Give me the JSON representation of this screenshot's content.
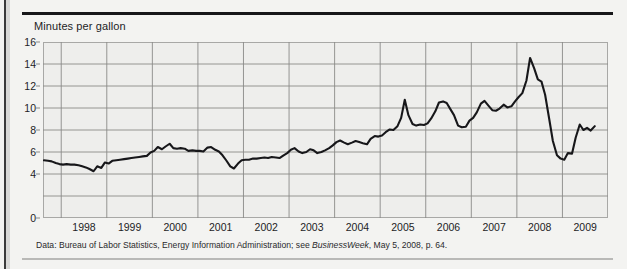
{
  "title": "Minutes per gallon",
  "footnote": {
    "prefix": "Data: Bureau of Labor Statistics, Energy Information Administration; see ",
    "italic": "BusinessWeek",
    "suffix": ", May 5, 2008, p. 64."
  },
  "colors": {
    "line": "#17171a",
    "plot_background": "#eeeeec",
    "page_background": "#f3f3f1",
    "grid": "#8a8a88",
    "frame": "#a8a8a6",
    "text": "#1d1d1f",
    "top_rule": "#17171a",
    "bottom_rule": "#b9b9b7"
  },
  "chart_data": {
    "type": "line",
    "title": "Minutes per gallon",
    "xlabel": "",
    "ylabel": "Minutes per gallon",
    "xlim": [
      1997.6,
      2010.0
    ],
    "ylim": [
      0,
      16
    ],
    "yticks": [
      0,
      2,
      4,
      6,
      8,
      10,
      12,
      14,
      16
    ],
    "ytick_labels": [
      "0",
      "4",
      "6",
      "8",
      "10",
      "12",
      "14",
      "16"
    ],
    "ytick_labels_shown": [
      0,
      4,
      6,
      8,
      10,
      12,
      14,
      16
    ],
    "xticks": [
      1998,
      1999,
      2000,
      2001,
      2002,
      2003,
      2004,
      2005,
      2006,
      2007,
      2008,
      2009,
      2010
    ],
    "xtick_labels": [
      "1998",
      "1999",
      "2000",
      "2001",
      "2002",
      "2003",
      "2004",
      "2005",
      "2006",
      "2007",
      "2008",
      "2009",
      "2010"
    ],
    "grid": true,
    "legend": false,
    "series": [
      {
        "name": "Minutes of work per gallon of gasoline",
        "x": [
          1997.62,
          1997.71,
          1997.79,
          1997.88,
          1997.96,
          1998.04,
          1998.12,
          1998.21,
          1998.29,
          1998.38,
          1998.46,
          1998.54,
          1998.62,
          1998.71,
          1998.79,
          1998.88,
          1998.96,
          1999.04,
          1999.12,
          1999.21,
          1999.29,
          1999.38,
          1999.46,
          1999.54,
          1999.62,
          1999.71,
          1999.79,
          1999.88,
          1999.96,
          2000.04,
          2000.12,
          2000.21,
          2000.29,
          2000.38,
          2000.46,
          2000.54,
          2000.62,
          2000.71,
          2000.79,
          2000.88,
          2000.96,
          2001.04,
          2001.12,
          2001.21,
          2001.29,
          2001.38,
          2001.46,
          2001.54,
          2001.62,
          2001.71,
          2001.79,
          2001.88,
          2001.96,
          2002.04,
          2002.12,
          2002.21,
          2002.29,
          2002.38,
          2002.46,
          2002.54,
          2002.62,
          2002.71,
          2002.79,
          2002.88,
          2002.96,
          2003.04,
          2003.12,
          2003.21,
          2003.29,
          2003.38,
          2003.46,
          2003.54,
          2003.62,
          2003.71,
          2003.79,
          2003.88,
          2003.96,
          2004.04,
          2004.12,
          2004.21,
          2004.29,
          2004.38,
          2004.46,
          2004.54,
          2004.62,
          2004.71,
          2004.79,
          2004.88,
          2004.96,
          2005.04,
          2005.12,
          2005.21,
          2005.29,
          2005.38,
          2005.46,
          2005.54,
          2005.62,
          2005.71,
          2005.79,
          2005.88,
          2005.96,
          2006.04,
          2006.12,
          2006.21,
          2006.29,
          2006.38,
          2006.46,
          2006.54,
          2006.62,
          2006.71,
          2006.79,
          2006.88,
          2006.96,
          2007.04,
          2007.12,
          2007.21,
          2007.29,
          2007.38,
          2007.46,
          2007.54,
          2007.62,
          2007.71,
          2007.79,
          2007.88,
          2007.96,
          2008.04,
          2008.12,
          2008.21,
          2008.29,
          2008.38,
          2008.46,
          2008.54,
          2008.62,
          2008.71,
          2008.79,
          2008.88,
          2008.96,
          2009.04,
          2009.12,
          2009.21,
          2009.29,
          2009.38,
          2009.46,
          2009.54,
          2009.62,
          2009.71
        ],
        "values": [
          5.25,
          5.2,
          5.15,
          5.0,
          4.9,
          4.85,
          4.9,
          4.85,
          4.85,
          4.8,
          4.7,
          4.6,
          4.45,
          4.25,
          4.7,
          4.55,
          5.05,
          4.95,
          5.2,
          5.25,
          5.3,
          5.35,
          5.4,
          5.45,
          5.5,
          5.55,
          5.6,
          5.65,
          5.95,
          6.1,
          6.45,
          6.25,
          6.5,
          6.75,
          6.35,
          6.3,
          6.35,
          6.3,
          6.1,
          6.15,
          6.1,
          6.1,
          6.05,
          6.4,
          6.45,
          6.2,
          6.05,
          5.7,
          5.25,
          4.7,
          4.5,
          4.95,
          5.25,
          5.3,
          5.3,
          5.4,
          5.4,
          5.45,
          5.5,
          5.45,
          5.55,
          5.5,
          5.45,
          5.7,
          5.9,
          6.2,
          6.35,
          6.05,
          5.9,
          6.0,
          6.25,
          6.15,
          5.9,
          6.0,
          6.15,
          6.35,
          6.6,
          6.9,
          7.05,
          6.85,
          6.7,
          6.85,
          7.0,
          6.9,
          6.8,
          6.7,
          7.2,
          7.45,
          7.4,
          7.5,
          7.8,
          8.05,
          8.0,
          8.35,
          9.1,
          10.75,
          9.35,
          8.55,
          8.4,
          8.5,
          8.45,
          8.6,
          9.05,
          9.7,
          10.5,
          10.6,
          10.45,
          9.9,
          9.35,
          8.4,
          8.25,
          8.3,
          8.85,
          9.1,
          9.6,
          10.4,
          10.65,
          10.2,
          9.8,
          9.75,
          9.95,
          10.3,
          10.05,
          10.15,
          10.6,
          11.0,
          11.35,
          12.5,
          14.55,
          13.6,
          12.6,
          12.4,
          11.2,
          9.0,
          7.0,
          5.7,
          5.4,
          5.3,
          5.9,
          5.85,
          7.3,
          8.5,
          8.0,
          8.2,
          7.95,
          8.35
        ]
      }
    ]
  }
}
